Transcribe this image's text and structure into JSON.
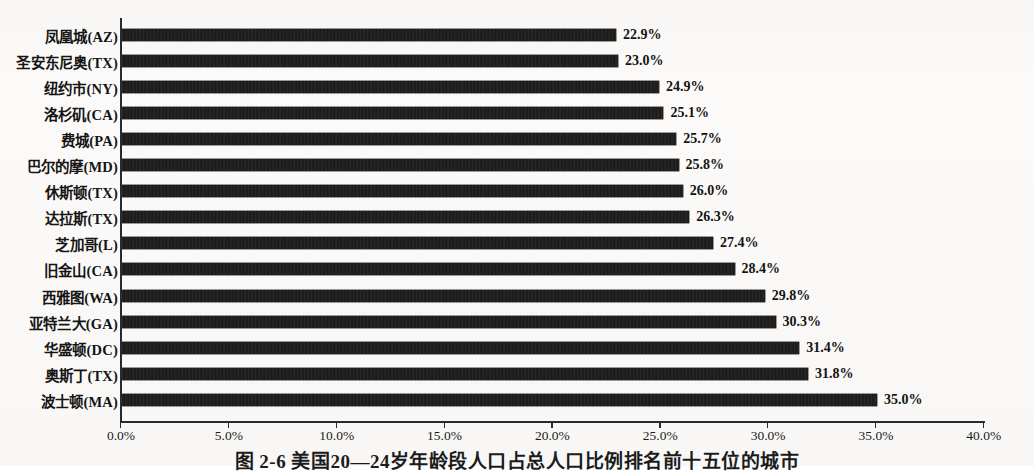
{
  "figure": {
    "caption": "图 2-6  美国20—24岁年龄段人口占总人口比例排名前十五位的城市"
  },
  "chart_data": {
    "type": "bar",
    "orientation": "horizontal",
    "title": "",
    "xlabel": "",
    "ylabel": "",
    "xlim": [
      0,
      40
    ],
    "grid": false,
    "legend": false,
    "value_suffix": "%",
    "tick_labels": [
      "0.0%",
      "5.0%",
      "10.0%",
      "15.0%",
      "20.0%",
      "25.0%",
      "30.0%",
      "35.0%",
      "40.0%"
    ],
    "ticks": [
      0,
      5,
      10,
      15,
      20,
      25,
      30,
      35,
      40
    ],
    "bar_color": "#171717",
    "categories": [
      "凤凰城(AZ)",
      "圣安东尼奥(TX)",
      "纽约市(NY)",
      "洛杉矶(CA)",
      "费城(PA)",
      "巴尔的摩(MD)",
      "休斯顿(TX)",
      "达拉斯(TX)",
      "芝加哥(L)",
      "旧金山(CA)",
      "西雅图(WA)",
      "亚特兰大(GA)",
      "华盛顿(DC)",
      "奥斯丁(TX)",
      "波士顿(MA)"
    ],
    "values": [
      22.9,
      23.0,
      24.9,
      25.1,
      25.7,
      25.8,
      26.0,
      26.3,
      27.4,
      28.4,
      29.8,
      30.3,
      31.4,
      31.8,
      35.0
    ],
    "data_labels": [
      "22.9%",
      "23.0%",
      "24.9%",
      "25.1%",
      "25.7%",
      "25.8%",
      "26.0%",
      "26.3%",
      "27.4%",
      "28.4%",
      "29.8%",
      "30.3%",
      "31.4%",
      "31.8%",
      "35.0%"
    ]
  }
}
